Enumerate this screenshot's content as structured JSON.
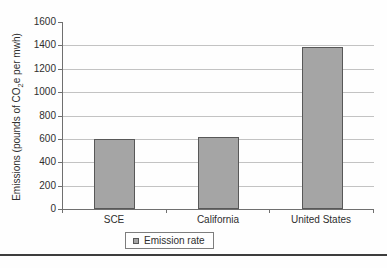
{
  "chart_data": {
    "type": "bar",
    "categories": [
      "SCE",
      "California",
      "United States"
    ],
    "values": [
      595,
      620,
      1390
    ],
    "series": [
      {
        "name": "Emission rate",
        "values": [
          595,
          620,
          1390
        ]
      }
    ],
    "title": "",
    "xlabel": "",
    "ylabel_pre": "Emissions (pounds of CO",
    "ylabel_sub": "2",
    "ylabel_post": "e per mwh)",
    "ylim": [
      0,
      1600
    ],
    "ytick_step": 200,
    "grid": true,
    "legend_position": "bottom",
    "legend_label": "Emission rate",
    "bar_color": "#a5a5a5",
    "bar_border_color": "#585858",
    "grid_color": "#c3c3c3",
    "axis_color": "#6f6f6f",
    "text_color": "#2e2e2e"
  },
  "figure": {
    "background": "#fefefe",
    "divider_color": "#3d3d3d"
  }
}
